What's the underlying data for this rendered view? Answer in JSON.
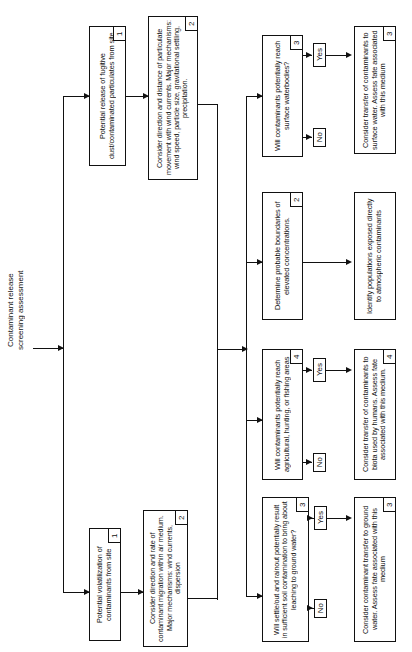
{
  "diagram": {
    "title": "Contaminant release\nscreening assessment",
    "orientation": "rotated-90-ccw-flowchart",
    "yes_label": "Yes",
    "no_label": "No",
    "nodes": [
      {
        "id": "n1a",
        "text": "Potential release of fugitive dust/contaminated particulates from site",
        "number": "1"
      },
      {
        "id": "n2a",
        "text": "Consider direction and distance of particulate movement with wind currents. Major mechanisms: wind speed, particle size, gravitational settling, precipitation.",
        "number": "2"
      },
      {
        "id": "n1b",
        "text": "Potential volatilization of contaminants from site",
        "number": "1"
      },
      {
        "id": "n2b",
        "text": "Consider direction and rate of contaminant migration within air medium. Major mechanisms: wind currents, dispersion",
        "number": "2"
      },
      {
        "id": "d3sw",
        "text": "Will contaminants potentially reach surface waterbodies?",
        "number": "3"
      },
      {
        "id": "a3sw",
        "text": "Consider transfer of contaminants to surface water. Assess fate associated with this medium",
        "number": "3"
      },
      {
        "id": "n2c",
        "text": "Determine probable boundaries of elevated concentrations.",
        "number": "2"
      },
      {
        "id": "n2c2",
        "text": "Identify populations exposed directly to atmospheric contaminants",
        "number": ""
      },
      {
        "id": "d4",
        "text": "Will contaminants potentially reach agricultural, hunting, or fishing areas",
        "number": "4"
      },
      {
        "id": "a4",
        "text": "Consider transfer of contaminants to biota used by humans. Assess fate associated with this medium.",
        "number": "4"
      },
      {
        "id": "d3gw",
        "text": "Will settle/out and rainout potentially result in sufficient soil contamination to bring about leaching to ground water?",
        "number": "3"
      },
      {
        "id": "a3gw",
        "text": "Consider contaminant transfer to ground water.  Assess fate associated with this medium",
        "number": "3"
      }
    ]
  }
}
